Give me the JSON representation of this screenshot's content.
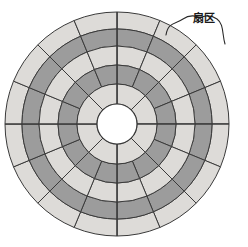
{
  "figure": {
    "title": "",
    "kind": "disk-platter-diagram",
    "background_color": "#ffffff"
  },
  "annotation": {
    "label": "扇区",
    "label_semantic": "sector",
    "brace_icon": "curly-brace-icon",
    "points_to": "outer-ring-sector"
  },
  "chart_data": {
    "type": "pie",
    "title": "",
    "xlabel": "",
    "ylabel": "",
    "center": {
      "cx": 117,
      "cy": 124
    },
    "hub_radius": 20,
    "outer_radius": 112,
    "ring_boundaries": [
      20,
      40,
      59,
      78,
      95,
      112
    ],
    "start_angle_deg": -90,
    "colors": {
      "light": "#dddbd8",
      "dark": "#9c9c9c",
      "hub": "#ffffff",
      "stroke": "#3a3a3a",
      "axis": "#3a3a3a",
      "text": "#1a1a1a"
    },
    "rings": [
      {
        "name": "track-5-outer",
        "index": 5,
        "inner_radius": 95,
        "outer_radius": 112,
        "sectors": 16,
        "fill": "light"
      },
      {
        "name": "track-4",
        "index": 4,
        "inner_radius": 78,
        "outer_radius": 95,
        "sectors": 16,
        "fill": "dark"
      },
      {
        "name": "track-3",
        "index": 3,
        "inner_radius": 59,
        "outer_radius": 78,
        "sectors": 16,
        "fill": "light"
      },
      {
        "name": "track-2",
        "index": 2,
        "inner_radius": 40,
        "outer_radius": 59,
        "sectors": 16,
        "fill": "dark"
      },
      {
        "name": "track-1-inner",
        "index": 1,
        "inner_radius": 20,
        "outer_radius": 40,
        "sectors": 8,
        "fill": "light"
      }
    ],
    "axes": [
      {
        "name": "vertical-axis-line",
        "x1": 117,
        "y1": 12,
        "x2": 117,
        "y2": 236
      },
      {
        "name": "horizontal-axis-line",
        "x1": 5,
        "y1": 124,
        "x2": 229,
        "y2": 124
      }
    ],
    "legend": {
      "entries": [
        "扇区"
      ],
      "position": "top-right"
    },
    "grid": false
  }
}
